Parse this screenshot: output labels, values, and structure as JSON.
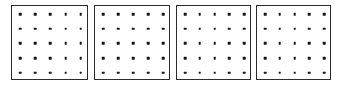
{
  "figure": {
    "title": "",
    "background_color": "#ffffff",
    "width": 342,
    "height": 85,
    "panel_count": 4,
    "panel_border_color": "#2b2b2b",
    "panel_fill_color": "#ffffff",
    "dot_color": "#141414",
    "dot_shape": "square",
    "dot_size_px": 2.6,
    "grid_rows": 5,
    "grid_cols": 5,
    "dots_per_panel": 25
  },
  "panels": [
    {
      "name": "panel-1",
      "caption": "",
      "x": 11,
      "y": 5,
      "width": 77,
      "height": 75,
      "dot_inset_x": 8,
      "dot_inset_y": 8,
      "dot_spacing_x": 15.2,
      "dot_spacing_y": 14.7,
      "rows": 5,
      "cols": 5
    },
    {
      "name": "panel-2",
      "caption": "",
      "x": 94,
      "y": 5,
      "width": 76,
      "height": 75,
      "dot_inset_x": 8,
      "dot_inset_y": 8,
      "dot_spacing_x": 15.0,
      "dot_spacing_y": 14.7,
      "rows": 5,
      "cols": 5
    },
    {
      "name": "panel-3",
      "caption": "",
      "x": 176,
      "y": 5,
      "width": 75,
      "height": 75,
      "dot_inset_x": 8,
      "dot_inset_y": 8,
      "dot_spacing_x": 14.8,
      "dot_spacing_y": 14.7,
      "rows": 5,
      "cols": 5
    },
    {
      "name": "panel-4",
      "caption": "",
      "x": 256,
      "y": 5,
      "width": 75,
      "height": 75,
      "dot_inset_x": 8,
      "dot_inset_y": 8,
      "dot_spacing_x": 14.8,
      "dot_spacing_y": 14.7,
      "rows": 5,
      "cols": 5
    }
  ]
}
